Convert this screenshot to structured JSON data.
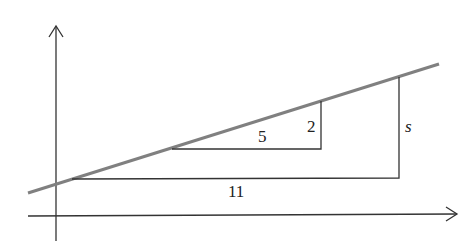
{
  "diagram": {
    "type": "slope-similar-triangles",
    "axes": {
      "x_axis": "horizontal arrow",
      "y_axis": "vertical arrow"
    },
    "line": {
      "color": "#808080",
      "description": "straight line with positive slope"
    },
    "small_triangle": {
      "run_label": "5",
      "rise_label": "2"
    },
    "large_triangle": {
      "run_label": "11",
      "rise_label": "s"
    },
    "colors": {
      "axes": "#333333",
      "line": "#808080",
      "triangles": "#333333"
    }
  }
}
